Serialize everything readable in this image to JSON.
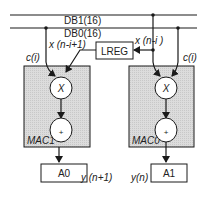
{
  "diagram": {
    "buses": [
      {
        "id": "db1",
        "label": "DB1(16)"
      },
      {
        "id": "db0",
        "label": "DB0(16)"
      }
    ],
    "register": {
      "label": "LREG"
    },
    "signals": {
      "x_prev": "x (n-i+1)",
      "x_curr": "x (n-i )",
      "c_left": "c(i)",
      "c_right": "c(i)"
    },
    "mac_units": [
      {
        "id": "mac1",
        "label": "MAC1",
        "multiplier_symbol": "X",
        "adder_symbol": "+"
      },
      {
        "id": "mac0",
        "label": "MAC0",
        "multiplier_symbol": "X",
        "adder_symbol": "+"
      }
    ],
    "accumulators": [
      {
        "id": "a0",
        "label": "A0",
        "output": "y (n+1)"
      },
      {
        "id": "a1",
        "label": "A1",
        "output": "y(n)"
      }
    ],
    "colors": {
      "line": "#1a1a1a",
      "mac_fill": "#d9d9d9",
      "box_fill": "#ffffff"
    }
  }
}
